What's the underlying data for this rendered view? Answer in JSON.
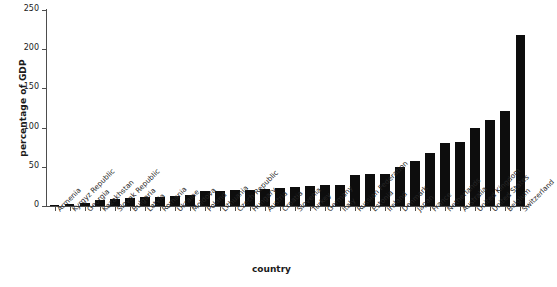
{
  "chart_data": {
    "type": "bar",
    "title": "",
    "xlabel": "country",
    "ylabel": "percentage of GDP",
    "ylim": [
      0,
      250
    ],
    "yticks": [
      0,
      50,
      100,
      150,
      200,
      250
    ],
    "grid": false,
    "legend": null,
    "bar_color": "#0d0d0d",
    "axis_color": "#4d4d4d",
    "categories": [
      "Armenia",
      "Kyrgyz Republic",
      "Georgia",
      "Kazakhstan",
      "Slovak Republic",
      "Bulgaria",
      "Latvia",
      "Romania",
      "Ukraine",
      "Moldova",
      "Poland",
      "Lithuania",
      "Czech Republic",
      "Hungary",
      "Austria",
      "Croatia",
      "Slovenia",
      "Turkey",
      "Germany",
      "Italy",
      "Russian Federation",
      "Estonia",
      "Ireland",
      "Denmark",
      "Japan",
      "France",
      "Netherlands",
      "Australia",
      "United Kingdom",
      "United States",
      "Belgium",
      "Switzerland"
    ],
    "values": [
      1,
      2,
      4,
      8,
      9,
      10,
      11,
      12,
      13,
      14,
      19,
      19,
      20,
      21,
      22,
      23,
      24,
      25,
      27,
      27,
      40,
      41,
      41,
      50,
      57,
      68,
      80,
      82,
      100,
      110,
      121,
      218
    ]
  }
}
